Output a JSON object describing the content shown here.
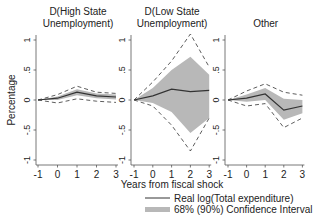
{
  "chart_data": [
    {
      "type": "line",
      "title": "D(High State Unemployment)",
      "title_lines": [
        "D(High State",
        "Unemployment)"
      ],
      "x": [
        -1,
        0,
        1,
        2,
        3
      ],
      "ylabel": "Percentage",
      "xlabel": "",
      "ylim": [
        -1,
        1
      ],
      "yticks": [
        "-1",
        "-.5",
        "0",
        ".5",
        "1"
      ],
      "xticks": [
        "-1",
        "0",
        "1",
        "2",
        "3"
      ],
      "series": [
        {
          "name": "Real log(Total expenditure)",
          "values": [
            0,
            0.03,
            0.13,
            0.07,
            0.05
          ]
        },
        {
          "name": "68% upper",
          "values": [
            0,
            0.06,
            0.18,
            0.11,
            0.09
          ]
        },
        {
          "name": "68% lower",
          "values": [
            0,
            0.0,
            0.08,
            0.03,
            0.01
          ]
        },
        {
          "name": "90% upper",
          "values": [
            0,
            0.09,
            0.23,
            0.13,
            0.11
          ]
        },
        {
          "name": "90% lower",
          "values": [
            0,
            -0.05,
            0.02,
            -0.02,
            -0.04
          ]
        }
      ]
    },
    {
      "type": "line",
      "title": "D(Low State Unemployment)",
      "title_lines": [
        "D(Low State",
        "Unemployment)"
      ],
      "x": [
        -1,
        0,
        1,
        2,
        3
      ],
      "xlabel": "Years from fiscal shock",
      "ylim": [
        -1,
        1
      ],
      "yticks": [
        "-1",
        "-.5",
        "0",
        ".5",
        "1"
      ],
      "xticks": [
        "-1",
        "0",
        "1",
        "2",
        "3"
      ],
      "series": [
        {
          "name": "Real log(Total expenditure)",
          "values": [
            0,
            0.07,
            0.18,
            0.14,
            0.16
          ]
        },
        {
          "name": "68% upper",
          "values": [
            0,
            0.2,
            0.5,
            0.72,
            0.42
          ]
        },
        {
          "name": "68% lower",
          "values": [
            0,
            -0.05,
            -0.2,
            -0.55,
            -0.3
          ]
        },
        {
          "name": "90% upper",
          "values": [
            0,
            0.3,
            0.65,
            1.1,
            0.55
          ]
        },
        {
          "name": "90% lower",
          "values": [
            0,
            -0.1,
            -0.42,
            -0.85,
            -0.3
          ]
        }
      ]
    },
    {
      "type": "line",
      "title": "Other",
      "title_lines": [
        "Other"
      ],
      "x": [
        -1,
        0,
        1,
        2,
        3
      ],
      "xlabel": "",
      "ylim": [
        -1,
        1
      ],
      "yticks": [
        "-1",
        "-.5",
        "0",
        ".5",
        "1"
      ],
      "xticks": [
        "-1",
        "0",
        "1",
        "2",
        "3"
      ],
      "series": [
        {
          "name": "Real log(Total expenditure)",
          "values": [
            0,
            0.03,
            0.1,
            -0.17,
            -0.1
          ]
        },
        {
          "name": "68% upper",
          "values": [
            0,
            0.09,
            0.2,
            0.02,
            0.0
          ]
        },
        {
          "name": "68% lower",
          "values": [
            0,
            -0.03,
            0.0,
            -0.33,
            -0.22
          ]
        },
        {
          "name": "90% upper",
          "values": [
            0,
            0.15,
            0.27,
            0.13,
            0.08
          ]
        },
        {
          "name": "90% lower",
          "values": [
            0,
            -0.1,
            -0.06,
            -0.46,
            -0.3
          ]
        }
      ]
    }
  ],
  "legend": {
    "line_label": "Real log(Total expenditure)",
    "band_label": "68% (90%) Confidence Interval"
  },
  "colors": {
    "line": "#333333",
    "band": "#b8b8b8",
    "dash": "#333333",
    "axis": "#555555"
  }
}
